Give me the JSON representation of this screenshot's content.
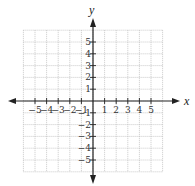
{
  "chart_data": {
    "type": "scatter",
    "title": "",
    "xlabel": "x",
    "ylabel": "y",
    "xlim": [
      -6,
      6
    ],
    "ylim": [
      -6,
      6
    ],
    "grid": true,
    "grid_style": "dotted",
    "x_ticks": [
      -5,
      -4,
      -3,
      -2,
      -1,
      1,
      2,
      3,
      4,
      5
    ],
    "y_ticks": [
      5,
      4,
      3,
      2,
      1,
      -1,
      -2,
      -3,
      -4,
      -5
    ],
    "x_tick_labels": [
      "−5",
      "−4",
      "−3",
      "−2",
      "−1",
      "1",
      "2",
      "3",
      "4",
      "5"
    ],
    "y_tick_labels": [
      "5",
      "4",
      "3",
      "2",
      "1",
      "−1",
      "−2",
      "−3",
      "−4",
      "−5"
    ],
    "series": [],
    "legend": null,
    "axes_arrows": true
  },
  "colors": {
    "axis": "#222222",
    "grid": "#bdbdbd",
    "text": "#333333"
  }
}
